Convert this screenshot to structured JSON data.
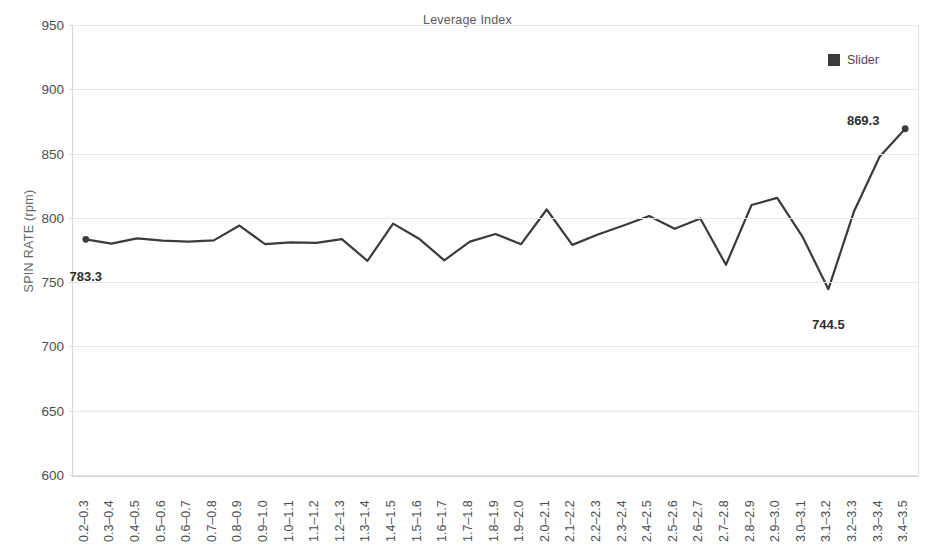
{
  "chart_data": {
    "type": "line",
    "title": "Leverage Index",
    "xlabel": "",
    "ylabel": "SPIN RATE (rpm)",
    "ylim": [
      600,
      950
    ],
    "ytick_step": 50,
    "yticks": [
      600,
      650,
      700,
      750,
      800,
      850,
      900,
      950
    ],
    "grid": true,
    "legend_position": "top-right",
    "legend": [
      "Slider"
    ],
    "series_color": "#3b3b3b",
    "categories": [
      "0.2–0.3",
      "0.3–0.4",
      "0.4–0.5",
      "0.5–0.6",
      "0.6–0.7",
      "0.7–0.8",
      "0.8–0.9",
      "0.9–1.0",
      "1.0–1.1",
      "1.1–1.2",
      "1.2–1.3",
      "1.3–1.4",
      "1.4–1.5",
      "1.5–1.6",
      "1.6–1.7",
      "1.7–1.8",
      "1.8–1.9",
      "1.9–2.0",
      "2.0–2.1",
      "2.1–2.2",
      "2.2–2.3",
      "2.3–2.4",
      "2.4–2.5",
      "2.5–2.6",
      "2.6–2.7",
      "2.7–2.8",
      "2.8–2.9",
      "2.9–3.0",
      "3.0–3.1",
      "3.1–3.2",
      "3.2–3.3",
      "3.3–3.4",
      "3.4–3.5"
    ],
    "series": [
      {
        "name": "Slider",
        "values": [
          783.3,
          780.0,
          784.0,
          782.3,
          781.5,
          782.5,
          794.0,
          779.5,
          781.0,
          780.5,
          783.5,
          766.5,
          795.5,
          784.0,
          767.0,
          781.5,
          787.5,
          779.5,
          806.5,
          779.0,
          787.0,
          794.0,
          801.5,
          791.5,
          799.5,
          763.5,
          810.0,
          815.5,
          785.0,
          744.5,
          805.0,
          847.5,
          869.3
        ]
      }
    ],
    "point_labels": [
      {
        "index": 0,
        "text": "783.3",
        "value": 783.3
      },
      {
        "index": 29,
        "text": "744.5",
        "value": 744.5
      },
      {
        "index": 32,
        "text": "869.3",
        "value": 869.3
      }
    ],
    "markers": [
      {
        "index": 0,
        "shape": "circle"
      },
      {
        "index": 32,
        "shape": "circle"
      }
    ]
  }
}
